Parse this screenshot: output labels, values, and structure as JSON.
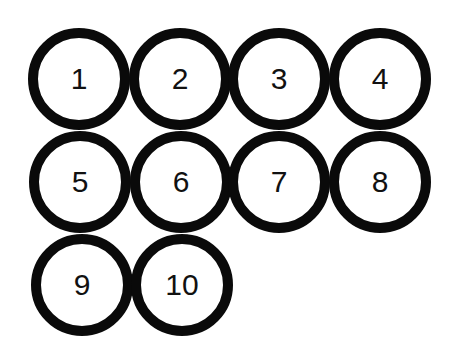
{
  "diagram": {
    "stroke_color": "#0a0a0a",
    "circles": [
      {
        "label": "1",
        "cx": 79,
        "cy": 79
      },
      {
        "label": "2",
        "cx": 180,
        "cy": 79
      },
      {
        "label": "3",
        "cx": 279,
        "cy": 79
      },
      {
        "label": "4",
        "cx": 380,
        "cy": 79
      },
      {
        "label": "5",
        "cx": 80,
        "cy": 182
      },
      {
        "label": "6",
        "cx": 181,
        "cy": 182
      },
      {
        "label": "7",
        "cx": 279,
        "cy": 182
      },
      {
        "label": "8",
        "cx": 380,
        "cy": 182
      },
      {
        "label": "9",
        "cx": 82,
        "cy": 285
      },
      {
        "label": "10",
        "cx": 182,
        "cy": 285
      }
    ]
  }
}
